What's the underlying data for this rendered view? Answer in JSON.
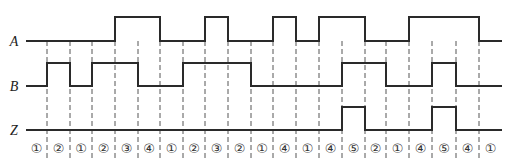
{
  "diagram": {
    "type": "timing-diagram",
    "signals": [
      {
        "name": "A",
        "high_intervals": [
          [
            4,
            6
          ],
          [
            8,
            9
          ],
          [
            11,
            12
          ],
          [
            13,
            15
          ],
          [
            17,
            20
          ]
        ]
      },
      {
        "name": "B",
        "high_intervals": [
          [
            1,
            2
          ],
          [
            3,
            5
          ],
          [
            7,
            10
          ],
          [
            14,
            16
          ],
          [
            18,
            19
          ]
        ]
      },
      {
        "name": "Z",
        "high_intervals": [
          [
            14,
            15
          ],
          [
            18,
            19
          ]
        ]
      }
    ],
    "boundaries_x": [
      26,
      47,
      70,
      92,
      115,
      138,
      160,
      183,
      205,
      228,
      251,
      273,
      296,
      319,
      342,
      365,
      386,
      409,
      432,
      456,
      479,
      502
    ],
    "states": [
      "①",
      "②",
      "①",
      "②",
      "③",
      "④",
      "①",
      "②",
      "③",
      "②",
      "①",
      "④",
      "①",
      "④",
      "⑤",
      "②",
      "①",
      "④",
      "⑤",
      "④",
      "①"
    ],
    "state_values": [
      1,
      2,
      1,
      2,
      3,
      4,
      1,
      2,
      3,
      2,
      1,
      4,
      1,
      4,
      5,
      2,
      1,
      4,
      5,
      4,
      1
    ]
  },
  "layout": {
    "rows": [
      {
        "name": "A",
        "low_y": 41,
        "high_y": 17,
        "label_x": 14
      },
      {
        "name": "B",
        "low_y": 86,
        "high_y": 63,
        "label_x": 14
      },
      {
        "name": "Z",
        "low_y": 130,
        "high_y": 107,
        "label_x": 14
      }
    ],
    "state_y": 148,
    "dash_top": 41,
    "dash_bottom": 158
  }
}
